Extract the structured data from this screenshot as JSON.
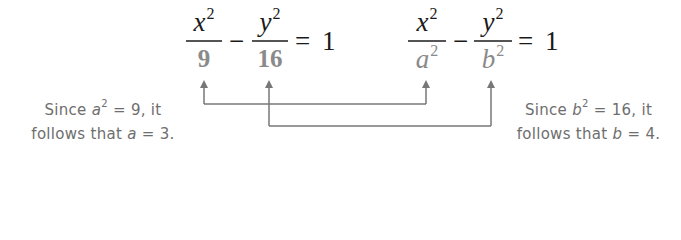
{
  "equation_left": {
    "term1": {
      "numerator": "x",
      "num_exp": "2",
      "denominator": "9"
    },
    "minus": "−",
    "term2": {
      "numerator": "y",
      "num_exp": "2",
      "denominator": "16"
    },
    "equals": "=",
    "rhs": "1"
  },
  "equation_right": {
    "term1": {
      "numerator": "x",
      "num_exp": "2",
      "denominator": "a",
      "den_exp": "2"
    },
    "minus": "−",
    "term2": {
      "numerator": "y",
      "num_exp": "2",
      "denominator": "b",
      "den_exp": "2"
    },
    "equals": "=",
    "rhs": "1"
  },
  "note_left": {
    "line1_pre": "Since ",
    "line1_var": "a",
    "line1_exp": "2",
    "line1_post": " = 9, it",
    "line2_pre": "follows that ",
    "line2_var": "a",
    "line2_post": " = 3."
  },
  "note_right": {
    "line1_pre": "Since ",
    "line1_var": "b",
    "line1_exp": "2",
    "line1_post": " = 16, it",
    "line2_pre": "follows that ",
    "line2_var": "b",
    "line2_post": " = 4."
  },
  "colors": {
    "numerator": "#1a1a1a",
    "denominator": "#8a8a8a",
    "connector": "#777777",
    "note_text": "#6e6e6e"
  }
}
